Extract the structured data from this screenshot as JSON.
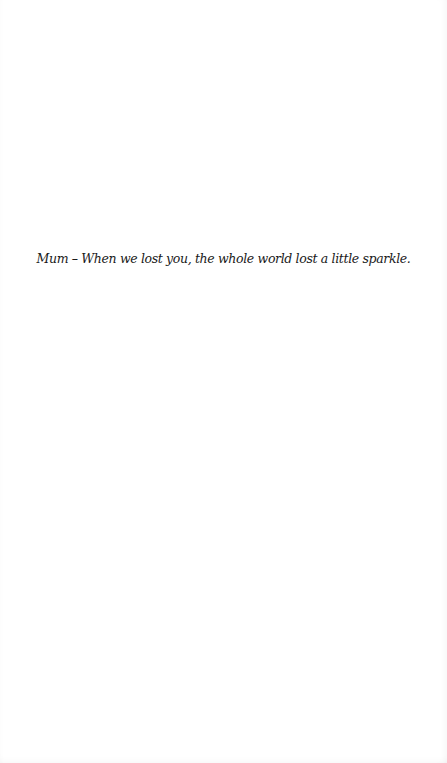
{
  "page": {
    "background_color": "#ffffff",
    "text_color": "#1a1a1a"
  },
  "dedication": {
    "text": "Mum – When we lost you, the whole world lost a little sparkle."
  }
}
